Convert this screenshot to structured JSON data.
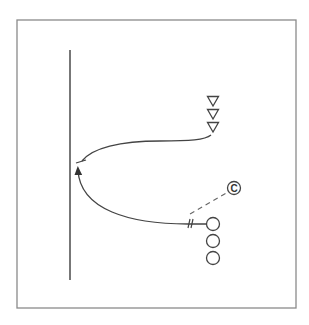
{
  "diagram": {
    "type": "drill-diagram",
    "colors": {
      "frame": "#8a8a8a",
      "stroke": "#444444",
      "background": "#ffffff"
    },
    "frame": {
      "x": 17,
      "y": 20,
      "width": 279,
      "height": 288
    },
    "boundary_line": {
      "x": 70,
      "y1": 50,
      "y2": 280
    },
    "defenders": [
      {
        "x": 213,
        "y": 101
      },
      {
        "x": 213,
        "y": 114
      },
      {
        "x": 213,
        "y": 127
      }
    ],
    "attackers": [
      {
        "x": 213,
        "y": 224
      },
      {
        "x": 213,
        "y": 241
      },
      {
        "x": 213,
        "y": 258
      }
    ],
    "coach": {
      "x": 234,
      "y": 188,
      "label": "C"
    },
    "pass_line": {
      "x1": 190,
      "y1": 214,
      "x2": 228,
      "y2": 192
    },
    "attacker_run": {
      "path": "M207,224 L188,224 C130,224 80,210 78,170"
    },
    "defender_run": {
      "path": "M211,135 C205,140 190,141 160,141 C120,141 92,148 82,161"
    }
  }
}
